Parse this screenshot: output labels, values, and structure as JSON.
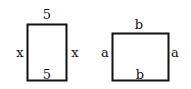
{
  "diagram": {
    "rectangles": [
      {
        "name": "rectangle-1",
        "top_label": "5",
        "bottom_label": "5",
        "left_label": "x",
        "right_label": "x"
      },
      {
        "name": "rectangle-2",
        "top_label": "b",
        "bottom_label": "b",
        "left_label": "a",
        "right_label": "a"
      }
    ],
    "stroke_color": "#111111"
  }
}
